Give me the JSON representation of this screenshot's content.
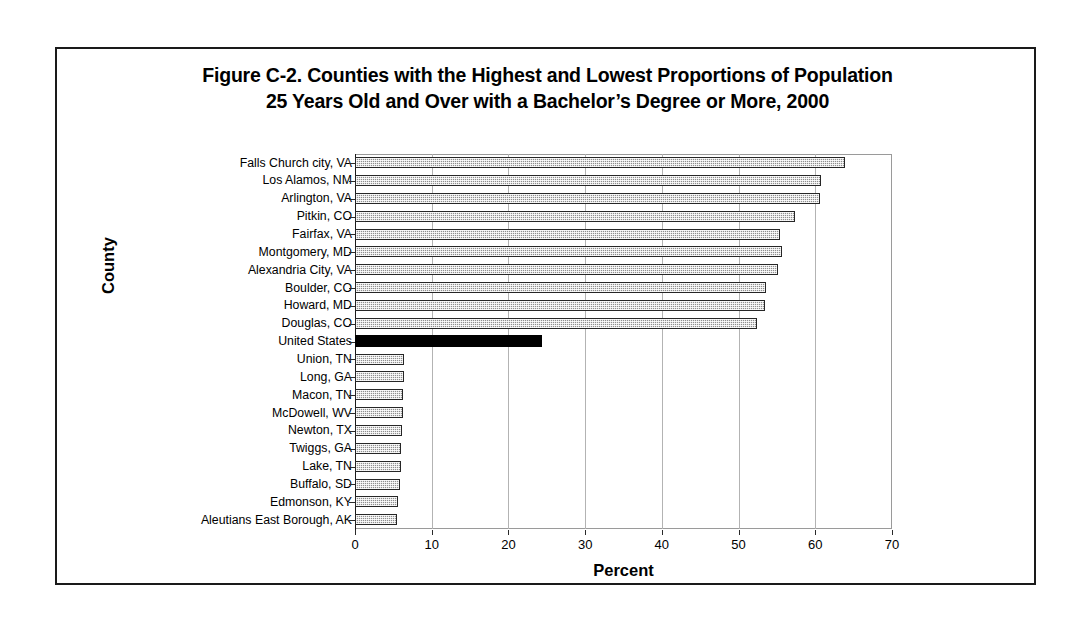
{
  "figure": {
    "title_line1": "Figure C-2. Counties with the Highest and Lowest Proportions of Population",
    "title_line2": "25 Years Old and Over with a Bachelor’s Degree or More, 2000"
  },
  "chart_data": {
    "type": "bar",
    "orientation": "horizontal",
    "title": "Figure C-2. Counties with the Highest and Lowest Proportions of Population 25 Years Old and Over with a Bachelor’s Degree or More, 2000",
    "xlabel": "Percent",
    "ylabel": "County",
    "xlim": [
      0,
      70
    ],
    "xticks": [
      0,
      10,
      20,
      30,
      40,
      50,
      60,
      70
    ],
    "xtick_labels": [
      "0",
      "10",
      "20",
      "30",
      "40",
      "50",
      "60",
      "70"
    ],
    "grid": "vertical",
    "legend": "none",
    "categories": [
      "Falls Church city, VA",
      "Los Alamos, NM",
      "Arlington, VA",
      "Pitkin, CO",
      "Fairfax, VA",
      "Montgomery, MD",
      "Alexandria City, VA",
      "Boulder, CO",
      "Howard, MD",
      "Douglas, CO",
      "United States",
      "Union, TN",
      "Long, GA",
      "Macon, TN",
      "McDowell, WV",
      "Newton, TX",
      "Twiggs, GA",
      "Lake, TN",
      "Buffalo, SD",
      "Edmonson, KY",
      "Aleutians East Borough, AK"
    ],
    "values": [
      63.9,
      60.8,
      60.6,
      57.4,
      55.4,
      55.6,
      55.2,
      53.6,
      53.5,
      52.4,
      24.4,
      6.4,
      6.4,
      6.3,
      6.2,
      6.1,
      6.0,
      6.0,
      5.9,
      5.6,
      5.5
    ],
    "highlight_category": "United States",
    "highlight_color": "#000000",
    "bar_color": "#8f8f8f",
    "bar_border_color": "#262626"
  }
}
